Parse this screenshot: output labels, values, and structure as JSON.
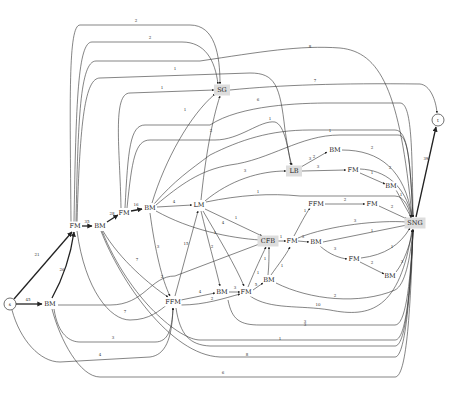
{
  "diagram": {
    "type": "directed-graph",
    "nodes": [
      {
        "id": "s",
        "label": "s",
        "shape": "circle",
        "x": 10,
        "y": 304
      },
      {
        "id": "t",
        "label": "t",
        "shape": "circle",
        "x": 438,
        "y": 120
      },
      {
        "id": "BM1",
        "label": "BM",
        "x": 50,
        "y": 304
      },
      {
        "id": "FM1",
        "label": "FM",
        "x": 75,
        "y": 226
      },
      {
        "id": "BM2",
        "label": "BM",
        "x": 100,
        "y": 226
      },
      {
        "id": "FM2",
        "label": "FM",
        "x": 124,
        "y": 213
      },
      {
        "id": "BM3",
        "label": "BM",
        "x": 150,
        "y": 208
      },
      {
        "id": "LM",
        "label": "LM",
        "x": 199,
        "y": 205
      },
      {
        "id": "SG",
        "label": "SG",
        "shape": "box-shaded",
        "x": 222,
        "y": 90
      },
      {
        "id": "LB",
        "label": "LB",
        "shape": "box-shaded",
        "x": 294,
        "y": 171
      },
      {
        "id": "BM4",
        "label": "BM",
        "x": 335,
        "y": 150
      },
      {
        "id": "FM3",
        "label": "FM",
        "x": 353,
        "y": 170
      },
      {
        "id": "BM5",
        "label": "BM",
        "x": 391,
        "y": 186
      },
      {
        "id": "FFM2",
        "label": "FFM",
        "x": 316,
        "y": 204
      },
      {
        "id": "FM4",
        "label": "FM",
        "x": 372,
        "y": 204
      },
      {
        "id": "SNG",
        "label": "SNG",
        "shape": "box-shaded",
        "x": 415,
        "y": 223
      },
      {
        "id": "CFB",
        "label": "CFB",
        "shape": "box-shaded",
        "x": 268,
        "y": 241
      },
      {
        "id": "FM5",
        "label": "FM",
        "x": 292,
        "y": 241
      },
      {
        "id": "BM6",
        "label": "BM",
        "x": 316,
        "y": 242
      },
      {
        "id": "FM6",
        "label": "FM",
        "x": 354,
        "y": 259
      },
      {
        "id": "BM7",
        "label": "BM",
        "x": 390,
        "y": 276
      },
      {
        "id": "FFM1",
        "label": "FFM",
        "x": 173,
        "y": 302
      },
      {
        "id": "BM8",
        "label": "BM",
        "x": 222,
        "y": 292
      },
      {
        "id": "FM7",
        "label": "FM",
        "x": 246,
        "y": 292
      },
      {
        "id": "BM9",
        "label": "BM",
        "x": 269,
        "y": 280
      }
    ],
    "edges": [
      {
        "from": "s",
        "to": "BM1",
        "label": "45",
        "thick": true,
        "path": "M16,304 L42,304",
        "lx": 28,
        "ly": 301
      },
      {
        "from": "s",
        "to": "FM1",
        "label": "21",
        "thick": true,
        "path": "M14,299 L72,232",
        "lx": 37,
        "ly": 256
      },
      {
        "from": "BM1",
        "to": "FM1",
        "label": "26",
        "thick": true,
        "path": "M52,298 C62,280 70,260 74,232",
        "lx": 62,
        "ly": 271
      },
      {
        "from": "FM1",
        "to": "BM2",
        "label": "35",
        "thick": true,
        "path": "M82,226 L92,226",
        "lx": 87,
        "ly": 223
      },
      {
        "from": "BM2",
        "to": "FM2",
        "label": "28",
        "thick": true,
        "path": "M107,222 L118,215",
        "lx": 112,
        "ly": 215
      },
      {
        "from": "FM2",
        "to": "BM3",
        "label": "16",
        "thick": true,
        "path": "M131,211 L142,209",
        "lx": 136,
        "ly": 206
      },
      {
        "from": "BM3",
        "to": "LM",
        "label": "4",
        "path": "M157,207 L192,205",
        "lx": 174,
        "ly": 203
      },
      {
        "from": "FM1",
        "to": "SG",
        "label": "2",
        "path": "M71,222 C70,100 68,25 80,25 L190,25 C215,25 220,55 220,84",
        "lx": 136,
        "ly": 22
      },
      {
        "from": "FM1",
        "to": "SG",
        "label": "2",
        "path": "M74,222 C76,100 78,42 92,42 L182,42 C205,42 215,60 218,84",
        "lx": 150,
        "ly": 39
      },
      {
        "from": "FM1",
        "to": "SNG",
        "label": "8",
        "path": "M76,222 C78,120 80,61 96,61 L200,61 C260,52 300,45 340,48 C380,52 400,90 412,217",
        "lx": 310,
        "ly": 48
      },
      {
        "from": "FM1",
        "to": "LB",
        "label": "1",
        "path": "M77,222 C80,120 85,78 100,78 L250,73 C275,73 280,85 285,130 C288,150 290,160 292,165",
        "lx": 175,
        "ly": 70
      },
      {
        "from": "FM2",
        "to": "SG",
        "label": "1",
        "path": "M121,208 C120,150 112,93 130,93 L214,90",
        "lx": 162,
        "ly": 89
      },
      {
        "from": "FM2",
        "to": "SNG",
        "label": "6",
        "path": "M125,208 C128,150 130,125 145,125 L210,125 C240,105 300,103 330,103 L400,103 C412,103 412,150 413,217",
        "lx": 258,
        "ly": 101
      },
      {
        "from": "FM2",
        "to": "LB",
        "label": "1",
        "path": "M127,208 C132,160 135,140 150,140 L215,140 C240,140 260,120 275,122 C285,125 288,150 291,165",
        "lx": 270,
        "ly": 120
      },
      {
        "from": "BM3",
        "to": "SG",
        "label": "1",
        "path": "M152,203 C165,160 190,115 215,94",
        "lx": 185,
        "ly": 111
      },
      {
        "from": "BM3",
        "to": "SNG",
        "label": "1",
        "path": "M154,204 C175,180 190,170 210,155 C240,140 270,130 310,130 L395,130 C408,130 410,160 413,217",
        "lx": 330,
        "ly": 132
      },
      {
        "from": "BM3",
        "to": "SNG",
        "label": "3",
        "path": "M156,205 C180,185 200,170 230,165 C270,160 300,135 340,135 L398,135 C408,135 410,160 413,217",
        "lx": 310,
        "ly": 160
      },
      {
        "from": "BM3",
        "to": "CFB",
        "label": "1",
        "path": "M156,211 C190,230 230,238 260,240",
        "lx": 215,
        "ly": 234
      },
      {
        "from": "BM3",
        "to": "FFM1",
        "label": "3",
        "path": "M150,213 C155,250 162,280 170,296",
        "lx": 158,
        "ly": 248
      },
      {
        "from": "LM",
        "to": "SG",
        "label": "2",
        "path": "M201,200 C205,160 212,120 220,96",
        "lx": 211,
        "ly": 132
      },
      {
        "from": "LM",
        "to": "LB",
        "label": "3",
        "path": "M205,201 C230,180 260,171 286,171",
        "lx": 245,
        "ly": 172
      },
      {
        "from": "LM",
        "to": "SNG",
        "label": "1",
        "path": "M206,202 C240,195 270,193 300,196 L395,196 C405,196 410,210 411,219",
        "lx": 258,
        "ly": 193
      },
      {
        "from": "LM",
        "to": "CFB",
        "label": "1",
        "path": "M205,209 L262,236",
        "lx": 236,
        "ly": 219
      },
      {
        "from": "LM",
        "to": "BM8",
        "label": "2",
        "path": "M201,211 C208,240 215,265 220,286",
        "lx": 212,
        "ly": 248
      },
      {
        "from": "LM",
        "to": "FM7",
        "label": "4",
        "path": "M203,211 C220,240 235,265 244,286",
        "lx": 223,
        "ly": 224
      },
      {
        "from": "FFM1",
        "to": "LM",
        "label": "15",
        "path": "M175,296 L198,211",
        "lx": 186,
        "ly": 245
      },
      {
        "from": "FFM1",
        "to": "BM8",
        "label": "4",
        "path": "M181,300 L215,293",
        "lx": 200,
        "ly": 293
      },
      {
        "from": "FFM1",
        "to": "FM7",
        "label": "2",
        "path": "M181,305 C205,305 225,298 240,294",
        "lx": 212,
        "ly": 300
      },
      {
        "from": "BM8",
        "to": "FM7",
        "label": "3",
        "path": "M229,292 L240,292",
        "lx": 235,
        "ly": 289
      },
      {
        "from": "FM7",
        "to": "BM9",
        "label": "5",
        "path": "M253,290 L263,283",
        "lx": 256,
        "ly": 286
      },
      {
        "from": "FM7",
        "to": "CFB",
        "label": "1",
        "path": "M248,287 C255,270 262,255 266,247",
        "lx": 258,
        "ly": 274
      },
      {
        "from": "FM7",
        "to": "SNG",
        "label": "10",
        "path": "M250,296 C270,310 300,305 330,310 C370,318 400,310 412,230",
        "lx": 318,
        "ly": 306
      },
      {
        "from": "BM9",
        "to": "FM5",
        "label": "1",
        "path": "M271,275 C278,265 286,255 290,247",
        "lx": 282,
        "ly": 267
      },
      {
        "from": "BM9",
        "to": "CFB",
        "label": "1",
        "path": "M268,275 C269,265 269,258 269,247",
        "lx": 265,
        "ly": 260
      },
      {
        "from": "BM9",
        "to": "SNG",
        "label": "2",
        "path": "M276,283 C310,300 360,305 395,290 C405,285 410,260 413,230",
        "lx": 335,
        "ly": 297
      },
      {
        "from": "CFB",
        "to": "FM5",
        "label": "1",
        "path": "M276,241 L286,241",
        "lx": 281,
        "ly": 238
      },
      {
        "from": "FM5",
        "to": "BM6",
        "label": "3",
        "path": "M298,241 L309,242",
        "lx": 303,
        "ly": 238
      },
      {
        "from": "FM5",
        "to": "FFM2",
        "label": "1",
        "path": "M294,236 C300,225 305,215 310,208",
        "lx": 305,
        "ly": 212
      },
      {
        "from": "FM5",
        "to": "SNG",
        "label": "3",
        "path": "M298,238 C330,225 380,220 407,222",
        "lx": 355,
        "ly": 222
      },
      {
        "from": "BM6",
        "to": "SNG",
        "label": "1",
        "path": "M323,242 L407,225",
        "lx": 372,
        "ly": 232
      },
      {
        "from": "BM6",
        "to": "FM6",
        "label": "3",
        "path": "M320,246 C330,255 340,258 347,259",
        "lx": 335,
        "ly": 250
      },
      {
        "from": "FM6",
        "to": "SNG",
        "label": "1",
        "path": "M361,258 C385,255 400,245 410,228",
        "lx": 392,
        "ly": 248
      },
      {
        "from": "FM6",
        "to": "BM7",
        "label": "2",
        "path": "M360,262 L384,274",
        "lx": 372,
        "ly": 264
      },
      {
        "from": "BM7",
        "to": "SNG",
        "label": "3",
        "path": "M396,272 C404,262 410,245 413,229",
        "lx": 402,
        "ly": 263
      },
      {
        "from": "FFM2",
        "to": "FM4",
        "label": "2",
        "path": "M325,204 L365,204",
        "lx": 345,
        "ly": 201
      },
      {
        "from": "FM4",
        "to": "SNG",
        "label": "2",
        "path": "M379,206 L407,219",
        "lx": 392,
        "ly": 208
      },
      {
        "from": "LB",
        "to": "BM4",
        "label": "2",
        "path": "M301,167 L327,152",
        "lx": 314,
        "ly": 158
      },
      {
        "from": "LB",
        "to": "FM3",
        "label": "3",
        "path": "M302,171 L346,170",
        "lx": 318,
        "ly": 168
      },
      {
        "from": "BM4",
        "to": "SNG",
        "label": "2",
        "path": "M342,150 C380,150 405,170 412,217",
        "lx": 372,
        "ly": 149
      },
      {
        "from": "FM3",
        "to": "SNG",
        "label": "2",
        "path": "M360,169 C385,170 405,185 412,217",
        "lx": 390,
        "ly": 169
      },
      {
        "from": "FM3",
        "to": "BM5",
        "label": "1",
        "path": "M360,173 L385,184",
        "lx": 372,
        "ly": 174
      },
      {
        "from": "BM5",
        "to": "SNG",
        "label": "1",
        "path": "M396,190 L411,217",
        "lx": 401,
        "ly": 196
      },
      {
        "from": "SG",
        "to": "t",
        "label": "7",
        "path": "M230,90 C280,85 340,83 420,84 C430,85 436,100 437,113",
        "lx": 315,
        "ly": 82
      },
      {
        "from": "SNG",
        "to": "t",
        "label": "39",
        "thick": true,
        "path": "M416,217 L436,127",
        "lx": 426,
        "ly": 160
      },
      {
        "from": "BM2",
        "to": "FFM1",
        "label": "7",
        "path": "M103,231 C120,260 150,285 168,297",
        "lx": 137,
        "ly": 261
      },
      {
        "from": "BM2",
        "to": "SNG",
        "label": "1",
        "path": "M102,231 C130,300 180,340 200,340 L395,340 C405,340 410,300 413,230",
        "lx": 280,
        "ly": 340
      },
      {
        "from": "FM1",
        "to": "FFM1",
        "label": "7",
        "path": "M77,231 C85,290 110,320 130,320 C150,320 160,310 168,304",
        "lx": 125,
        "ly": 313
      },
      {
        "from": "BM1",
        "to": "CFB",
        "label": "2",
        "path": "M58,305 L110,305 C145,305 150,276 175,276 L262,243",
        "lx": 162,
        "ly": 278
      },
      {
        "from": "BM1",
        "to": "FFM1",
        "label": "3",
        "path": "M54,309 C58,335 70,342 80,342 L155,342 C168,342 172,330 173,308",
        "lx": 113,
        "ly": 339
      },
      {
        "from": "BM1",
        "to": "SNG",
        "label": "6",
        "path": "M52,309 C60,340 80,377 100,377 L395,377 C405,377 410,330 413,230",
        "lx": 223,
        "ly": 374
      },
      {
        "from": "s",
        "to": "FFM1",
        "label": "4",
        "path": "M12,310 C20,340 40,362 60,362 L150,357 C165,355 172,340 173,308",
        "lx": 100,
        "ly": 356
      },
      {
        "from": "FFM1",
        "to": "SNG",
        "label": "3",
        "path": "M176,308 C180,335 190,345 210,346 L395,346 C405,346 410,300 413,230",
        "lx": 305,
        "ly": 326
      },
      {
        "from": "BM2",
        "to": "SNG",
        "label": "8",
        "path": "M101,231 C120,280 170,355 220,357 L395,357 C405,357 410,300 413,230",
        "lx": 247,
        "ly": 356
      },
      {
        "from": "FFM1",
        "to": "SNG",
        "label": "3",
        "path": "M228,300 C232,320 240,325 260,325 L395,325 C405,325 410,290 413,230",
        "lx": 305,
        "ly": 323
      },
      {
        "from": "LM",
        "to": "SNG",
        "label": "1",
        "path": "M200,200 C200,150 205,60 215,60",
        "lx": 0,
        "ly": 0
      }
    ]
  }
}
